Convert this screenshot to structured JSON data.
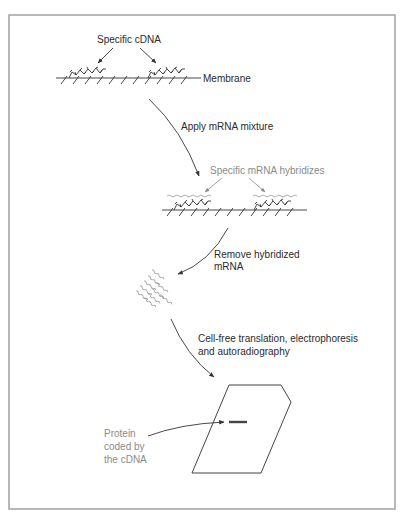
{
  "figure": {
    "frame": {
      "x": 9,
      "y": 15,
      "width": 386,
      "height": 494,
      "color": "#9a9a9a"
    },
    "labels": {
      "specific_cdna": "Specific cDNA",
      "membrane": "Membrane",
      "apply_mrna": "Apply mRNA mixture",
      "specific_mrna_hybridizes": "Specific mRNA hybridizes",
      "remove_line1": "Remove hybridized",
      "remove_line2": "mRNA",
      "translation_line1": "Cell-free translation, electrophoresis",
      "translation_line2": "and autoradiography",
      "protein_line1": "Protein",
      "protein_line2": "coded by",
      "protein_line3": "the cDNA"
    },
    "colors": {
      "text": "#2a2a2a",
      "gray_text": "#8a8a8a",
      "line": "#333333"
    },
    "steps": [
      {
        "id": "membrane-with-cdna",
        "label": "Membrane"
      },
      {
        "id": "hybridization",
        "label": "Apply mRNA mixture"
      },
      {
        "id": "elution",
        "label": "Remove hybridized mRNA"
      },
      {
        "id": "translation-gel",
        "label": "Cell-free translation, electrophoresis and autoradiography"
      }
    ]
  }
}
